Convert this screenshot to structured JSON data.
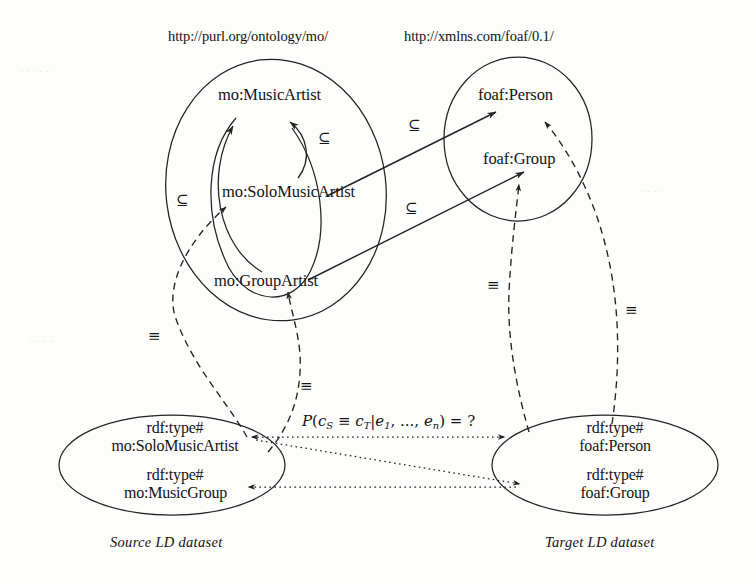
{
  "figure": {
    "type": "ontology-alignment-diagram",
    "namespaces": [
      {
        "id": "mo",
        "url": "http://purl.org/ontology/mo/"
      },
      {
        "id": "foaf",
        "url": "http://xmlns.com/foaf/0.1/"
      }
    ],
    "source_ontology": {
      "classes": [
        {
          "id": "mo-musicartist",
          "label": "mo:MusicArtist"
        },
        {
          "id": "mo-solomusicartist",
          "label": "mo:SoloMusicArtist"
        },
        {
          "id": "mo-groupartist",
          "label": "mo:GroupArtist"
        }
      ]
    },
    "target_ontology": {
      "classes": [
        {
          "id": "foaf-person",
          "label": "foaf:Person"
        },
        {
          "id": "foaf-group",
          "label": "foaf:Group"
        }
      ]
    },
    "subsumption_symbol": "⊆",
    "equivalence_symbol": "≡",
    "subsumption_labels": [
      {
        "id": "sub-outer-left",
        "text": "⊆"
      },
      {
        "id": "sub-inner-center",
        "text": "⊆"
      },
      {
        "id": "sub-cross-person",
        "text": "⊆"
      },
      {
        "id": "sub-cross-group",
        "text": "⊆"
      }
    ],
    "equivalence_labels": [
      {
        "id": "eq-source-solo",
        "text": "≡"
      },
      {
        "id": "eq-source-group",
        "text": "≡"
      },
      {
        "id": "eq-target-group",
        "text": "≡"
      },
      {
        "id": "eq-target-person",
        "text": "≡"
      }
    ],
    "source_dataset": {
      "caption": "Source LD dataset",
      "entries": [
        {
          "predicate": "rdf:type#",
          "object": "mo:SoloMusicArtist"
        },
        {
          "predicate": "rdf:type#",
          "object": "mo:MusicGroup"
        }
      ]
    },
    "target_dataset": {
      "caption": "Target LD dataset",
      "entries": [
        {
          "predicate": "rdf:type#",
          "object": "foaf:Person"
        },
        {
          "predicate": "rdf:type#",
          "object": "foaf:Group"
        }
      ]
    },
    "formula": {
      "full": "P(c_S ≡ c_T|e_1, ..., e_n) = ?",
      "p": "P",
      "open": "(",
      "c_s": "c",
      "c_s_sub": "S",
      "equiv": "≡",
      "c_t": "c",
      "c_t_sub": "T",
      "bar": "|",
      "e1": "e",
      "e1_sub": "1",
      "ellipsis": ", ..., ",
      "en": "e",
      "en_sub": "n",
      "close": ")",
      "eq": "=",
      "question": "?"
    },
    "colors": {
      "stroke": "#222222",
      "background": "#fdfdfc",
      "text": "#141414"
    }
  }
}
